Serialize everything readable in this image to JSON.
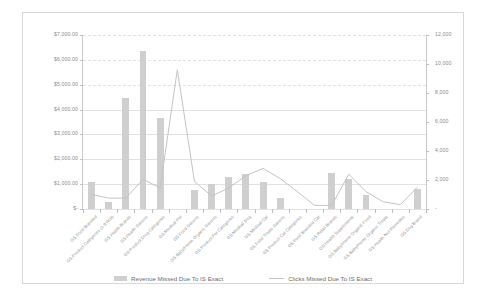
{
  "chart_data": {
    "type": "bar",
    "title": "",
    "xlabel": "",
    "ylabel": "",
    "grid": true,
    "legend_position": "bottom",
    "categories": [
      "GS Food Branded",
      "GS Product Categories (1-9 ROI)",
      "GS Health Brands",
      "GS Health Generic",
      "GS Product Drug Categories",
      "GS Medical Pet",
      "GS Food Generic",
      "GS Baby/Home Organic Generic",
      "GS Product Pet Categories",
      "GS Medical Dog",
      "GS Medical Cat",
      "GS Food Treats Generic",
      "GS Product Cat Categories",
      "GS Food Branded Cat",
      "GS Retail Brands",
      "GS Health Supplements",
      "GS Baby/Home Organic Food",
      "GS Baby/Home Organic Treats",
      "GS Health Nut Remedies",
      "GS Dog Brand"
    ],
    "series": [
      {
        "name": "Revenue Missed Due To IS Exact",
        "axis": "left",
        "type": "bar",
        "color": "#cfcfcf",
        "values": [
          1100,
          300,
          4450,
          6350,
          3650,
          0,
          750,
          1000,
          1300,
          1400,
          1100,
          450,
          0,
          0,
          1450,
          1200,
          550,
          0,
          0,
          800
        ]
      },
      {
        "name": "Clicks Missed Due To IS Exact",
        "axis": "right",
        "type": "line",
        "color": "#c4c4c4",
        "values": [
          1000,
          750,
          750,
          2050,
          1450,
          9600,
          1900,
          900,
          1450,
          2300,
          2800,
          2100,
          1200,
          250,
          250,
          2400,
          1200,
          500,
          300,
          1500
        ]
      }
    ],
    "left_axis": {
      "min": 0,
      "max": 7000,
      "step": 1000,
      "tick_labels": [
        "$-",
        "$1,000.00",
        "$2,000.00",
        "$3,000.00",
        "$4,000.00",
        "$5,000.00",
        "$6,000.00",
        "$7,000.00"
      ]
    },
    "right_axis": {
      "min": 0,
      "max": 12000,
      "step": 2000,
      "tick_labels": [
        "-",
        "2,000",
        "4,000",
        "6,000",
        "8,000",
        "10,000",
        "12,000"
      ]
    }
  },
  "legend": {
    "items": [
      {
        "label": "Revenue Missed Due To IS Exact",
        "marker": "bar-swatch"
      },
      {
        "label": "Clicks Missed Due To IS Exact",
        "marker": "line-swatch"
      }
    ]
  }
}
